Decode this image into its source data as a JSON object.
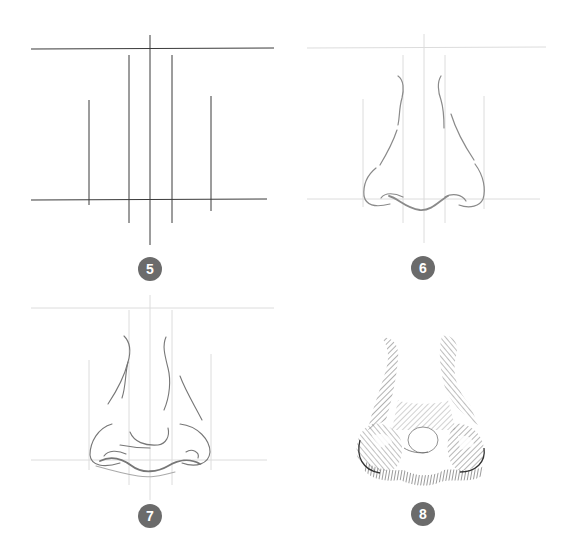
{
  "colors": {
    "badge_bg": "#6b6b6b",
    "badge_text": "#ffffff",
    "guide_dark": "#3a3a3a",
    "guide_light": "#d6d6d6",
    "sketch": "#7a7a7a",
    "background": "#ffffff"
  },
  "steps": [
    {
      "number": "5",
      "description": "Guide lines: two horizontal lines and five vertical lines"
    },
    {
      "number": "6",
      "description": "Outline of the nose bridge, wings and base over faint guides"
    },
    {
      "number": "7",
      "description": "Refined sketch with nostrils, tip and wings"
    },
    {
      "number": "8",
      "description": "Finished hatched shading of the nose"
    }
  ]
}
